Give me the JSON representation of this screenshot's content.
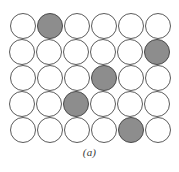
{
  "figure": {
    "caption": "(a)",
    "kind": "atomic-packing-diagram",
    "colors": {
      "background": "#ffffff",
      "circle_fill": "#ffffff",
      "circle_outline": "#5b5b5b",
      "shaded_fill": "#8d8d8d",
      "shaded_outline": "#4a4a4a",
      "caption_text": "#3a3a3a"
    },
    "grid": {
      "rows": 5,
      "columns": 6,
      "circle_diameter": 26,
      "column_spacing": 27,
      "row_spacing": 26,
      "origin_x": 10,
      "origin_y": 13,
      "row_offsets": [
        0,
        1,
        2,
        3,
        4
      ],
      "shaded_count": 5,
      "total_count": 30
    },
    "circles": [
      {
        "row": 1,
        "col": 1,
        "x": 10,
        "y": 13,
        "shaded": false
      },
      {
        "row": 1,
        "col": 2,
        "x": 37,
        "y": 13,
        "shaded": true
      },
      {
        "row": 1,
        "col": 3,
        "x": 64,
        "y": 13,
        "shaded": false
      },
      {
        "row": 1,
        "col": 4,
        "x": 91,
        "y": 13,
        "shaded": false
      },
      {
        "row": 1,
        "col": 5,
        "x": 118,
        "y": 13,
        "shaded": false
      },
      {
        "row": 1,
        "col": 6,
        "x": 145,
        "y": 13,
        "shaded": false
      },
      {
        "row": 2,
        "col": 1,
        "x": 9,
        "y": 39,
        "shaded": false
      },
      {
        "row": 2,
        "col": 2,
        "x": 36,
        "y": 39,
        "shaded": false
      },
      {
        "row": 2,
        "col": 3,
        "x": 63,
        "y": 39,
        "shaded": false
      },
      {
        "row": 2,
        "col": 4,
        "x": 90,
        "y": 39,
        "shaded": false
      },
      {
        "row": 2,
        "col": 5,
        "x": 117,
        "y": 39,
        "shaded": false
      },
      {
        "row": 2,
        "col": 6,
        "x": 144,
        "y": 39,
        "shaded": true
      },
      {
        "row": 3,
        "col": 1,
        "x": 10,
        "y": 65,
        "shaded": false
      },
      {
        "row": 3,
        "col": 2,
        "x": 37,
        "y": 65,
        "shaded": false
      },
      {
        "row": 3,
        "col": 3,
        "x": 64,
        "y": 65,
        "shaded": false
      },
      {
        "row": 3,
        "col": 4,
        "x": 91,
        "y": 65,
        "shaded": true
      },
      {
        "row": 3,
        "col": 5,
        "x": 118,
        "y": 65,
        "shaded": false
      },
      {
        "row": 3,
        "col": 6,
        "x": 145,
        "y": 65,
        "shaded": false
      },
      {
        "row": 4,
        "col": 1,
        "x": 9,
        "y": 91,
        "shaded": false
      },
      {
        "row": 4,
        "col": 2,
        "x": 36,
        "y": 91,
        "shaded": false
      },
      {
        "row": 4,
        "col": 3,
        "x": 63,
        "y": 91,
        "shaded": true
      },
      {
        "row": 4,
        "col": 4,
        "x": 90,
        "y": 91,
        "shaded": false
      },
      {
        "row": 4,
        "col": 5,
        "x": 117,
        "y": 91,
        "shaded": false
      },
      {
        "row": 4,
        "col": 6,
        "x": 144,
        "y": 91,
        "shaded": false
      },
      {
        "row": 5,
        "col": 1,
        "x": 10,
        "y": 117,
        "shaded": false
      },
      {
        "row": 5,
        "col": 2,
        "x": 37,
        "y": 117,
        "shaded": false
      },
      {
        "row": 5,
        "col": 3,
        "x": 64,
        "y": 117,
        "shaded": false
      },
      {
        "row": 5,
        "col": 4,
        "x": 91,
        "y": 117,
        "shaded": false
      },
      {
        "row": 5,
        "col": 5,
        "x": 118,
        "y": 117,
        "shaded": true
      },
      {
        "row": 5,
        "col": 6,
        "x": 145,
        "y": 117,
        "shaded": false
      }
    ]
  }
}
